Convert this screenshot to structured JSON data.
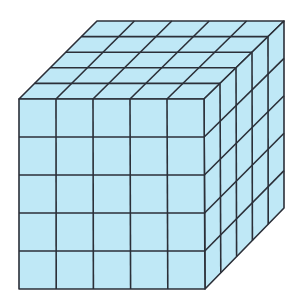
{
  "diagram": {
    "grid_divisions": 5,
    "colors": {
      "fill": "#bfe8f6",
      "line": "#2b2f38",
      "background": "#ffffff"
    },
    "vertices": {
      "front_top_left": [
        19,
        99
      ],
      "front_top_right": [
        204,
        99
      ],
      "front_bottom_left": [
        19,
        289
      ],
      "front_bottom_right": [
        205,
        289
      ],
      "back_top_left": [
        97,
        21
      ],
      "back_top_right": [
        284,
        21
      ],
      "back_bottom_right": [
        284,
        208
      ]
    },
    "faces": [
      "front",
      "top",
      "right"
    ]
  }
}
